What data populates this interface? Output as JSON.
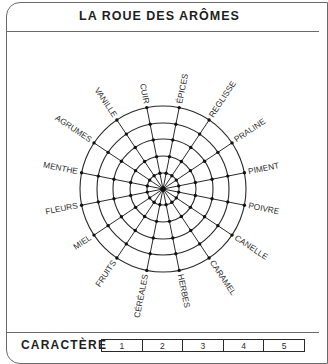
{
  "header": {
    "title": "LA ROUE DES ARÔMES"
  },
  "wheel": {
    "center": [
      163,
      189
    ],
    "ring_radii": [
      16,
      33,
      50,
      66,
      83
    ],
    "spoke_count": 16,
    "line_color": "#2a2a2a",
    "labels": [
      {
        "text": "ÉPICES",
        "angle": 11.25
      },
      {
        "text": "REGLISSE",
        "angle": 33.75
      },
      {
        "text": "PRALINE",
        "angle": 56.25
      },
      {
        "text": "PIMENT",
        "angle": 78.75
      },
      {
        "text": "POIVRE",
        "angle": 101.25
      },
      {
        "text": "CANELLE",
        "angle": 123.75
      },
      {
        "text": "CARAMEL",
        "angle": 146.25
      },
      {
        "text": "HERBES",
        "angle": 168.75
      },
      {
        "text": "CÉRÉALES",
        "angle": 191.25
      },
      {
        "text": "FRUITS",
        "angle": 213.75
      },
      {
        "text": "MIEL",
        "angle": 236.25
      },
      {
        "text": "FLEURS",
        "angle": 258.75
      },
      {
        "text": "MENTHE",
        "angle": 281.25
      },
      {
        "text": "AGRUMES",
        "angle": 303.75
      },
      {
        "text": "VANILLE",
        "angle": 326.25
      },
      {
        "text": "CUIR",
        "angle": 348.75
      }
    ]
  },
  "footer": {
    "label": "CARACTÈRE",
    "scale": [
      "1",
      "2",
      "3",
      "4",
      "5"
    ]
  }
}
